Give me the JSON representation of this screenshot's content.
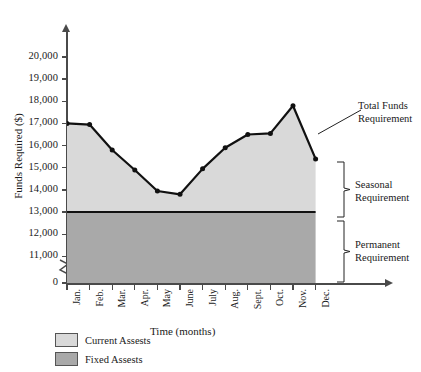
{
  "chart_data": {
    "type": "area",
    "title": "",
    "xlabel": "Time (months)",
    "ylabel": "Funds Required ($)",
    "categories": [
      "Jan.",
      "Feb.",
      "Mar.",
      "Apr.",
      "May",
      "June",
      "July",
      "Aug.",
      "Sept.",
      "Oct.",
      "Nov.",
      "Dec."
    ],
    "ytick_labels": [
      "20,000",
      "19,000",
      "18,000",
      "17,000",
      "16,000",
      "15,000",
      "14,000",
      "13,000",
      "12,000",
      "11,000",
      "0"
    ],
    "ytick_values": [
      20000,
      19000,
      18000,
      17000,
      16000,
      15000,
      14000,
      13000,
      12000,
      11000,
      0
    ],
    "ylim": [
      10500,
      20600
    ],
    "axis_break": true,
    "grid": false,
    "legend_position": "bottom-left",
    "series": [
      {
        "name": "Total Funds Requirement",
        "values": [
          17000,
          16950,
          15800,
          14900,
          13950,
          13800,
          14950,
          15900,
          16500,
          16550,
          17800,
          15400
        ],
        "marker": "dot",
        "line_color": "#111111"
      },
      {
        "name": "Fixed Assets (Permanent Requirement)",
        "values": [
          13000,
          13000,
          13000,
          13000,
          13000,
          13000,
          13000,
          13000,
          13000,
          13000,
          13000,
          13000
        ],
        "line_color": "#111111"
      }
    ],
    "bands": [
      {
        "name": "Current Assets",
        "color": "#d9d9d9",
        "from_series": "Fixed Assets (Permanent Requirement)",
        "to_series": "Total Funds Requirement"
      },
      {
        "name": "Fixed Assets",
        "color": "#a9a9a9",
        "from_value": 0,
        "to_series": "Fixed Assets (Permanent Requirement)"
      }
    ],
    "annotations": [
      {
        "id": "total",
        "line1": "Total Funds",
        "line2": "Requirement"
      },
      {
        "id": "seasonal",
        "line1": "Seasonal",
        "line2": "Requirement"
      },
      {
        "id": "permanent",
        "line1": "Permanent",
        "line2": "Requirement"
      }
    ]
  },
  "legend": {
    "items": [
      {
        "label": "Current Assests",
        "color": "#d9d9d9"
      },
      {
        "label": "Fixed Assests",
        "color": "#a9a9a9"
      }
    ]
  },
  "colors": {
    "current_assets": "#d9d9d9",
    "fixed_assets": "#a9a9a9",
    "line": "#111111",
    "axis": "#4a4a4a"
  }
}
